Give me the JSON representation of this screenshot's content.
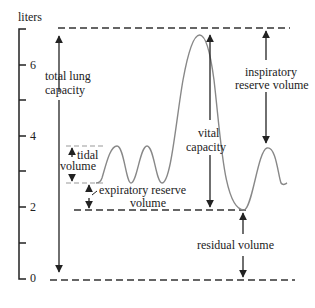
{
  "diagram": {
    "y_axis": {
      "unit_label": "liters",
      "ticks": [
        {
          "value": 0,
          "label": "0"
        },
        {
          "value": 1,
          "label": ""
        },
        {
          "value": 2,
          "label": "2"
        },
        {
          "value": 3,
          "label": ""
        },
        {
          "value": 4,
          "label": "4"
        },
        {
          "value": 5,
          "label": ""
        },
        {
          "value": 6,
          "label": "6"
        },
        {
          "value": 7,
          "label": ""
        }
      ]
    },
    "labels": {
      "total_lung_capacity_1": "total lung",
      "total_lung_capacity_2": "capacity",
      "tidal_1": "tidal",
      "tidal_2": "volume",
      "erv_1": "expiratory reserve",
      "erv_2": "volume",
      "vital_1": "vital",
      "vital_2": "capacity",
      "irv_1": "inspiratory",
      "irv_2": "reserve volume",
      "residual": "residual volume"
    },
    "colors": {
      "line": "#222222",
      "curve": "#888888",
      "dashed": "#333333"
    }
  }
}
